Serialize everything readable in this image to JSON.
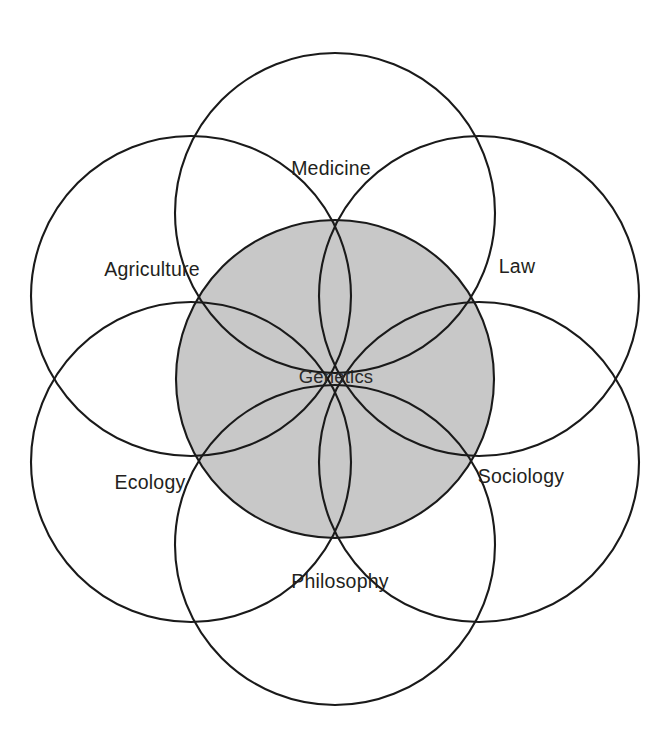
{
  "diagram": {
    "type": "venn",
    "background_color": "#ffffff",
    "stroke_color": "#1a1a1a",
    "core": {
      "label": "Genetics",
      "fill_color": "#c8c8c8",
      "center": {
        "x": 335,
        "y": 379
      },
      "radius": 159,
      "label_position": {
        "x": 336,
        "y": 378
      }
    },
    "petals": [
      {
        "id": "medicine",
        "label": "Medicine",
        "center": {
          "x": 335,
          "y": 213
        },
        "radius": 160,
        "label_position": {
          "x": 331,
          "y": 170
        },
        "fill_color": "#ffffff"
      },
      {
        "id": "law",
        "label": "Law",
        "center": {
          "x": 479,
          "y": 296
        },
        "radius": 160,
        "label_position": {
          "x": 517,
          "y": 268
        },
        "fill_color": "#ffffff"
      },
      {
        "id": "sociology",
        "label": "Sociology",
        "center": {
          "x": 479,
          "y": 462
        },
        "radius": 160,
        "label_position": {
          "x": 521,
          "y": 478
        },
        "fill_color": "#ffffff"
      },
      {
        "id": "philosophy",
        "label": "Philosophy",
        "center": {
          "x": 335,
          "y": 545
        },
        "radius": 160,
        "label_position": {
          "x": 340,
          "y": 583
        },
        "fill_color": "#ffffff"
      },
      {
        "id": "ecology",
        "label": "Ecology",
        "center": {
          "x": 191,
          "y": 462
        },
        "radius": 160,
        "label_position": {
          "x": 150,
          "y": 484
        },
        "fill_color": "#ffffff"
      },
      {
        "id": "agriculture",
        "label": "Agriculture",
        "center": {
          "x": 191,
          "y": 296
        },
        "radius": 160,
        "label_position": {
          "x": 152,
          "y": 271
        },
        "fill_color": "#ffffff"
      }
    ]
  }
}
